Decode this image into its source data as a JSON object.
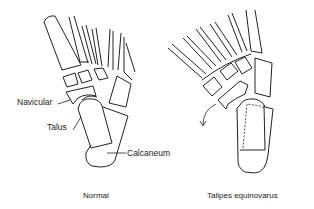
{
  "diagram": {
    "left_panel": {
      "caption": "Normal",
      "labels": {
        "navicular": "Navicular",
        "talus": "Talus",
        "calcaneum": "Calcaneum"
      }
    },
    "right_panel": {
      "caption": "Talipes equinovarus",
      "annotations": [
        "rotation-arrow"
      ]
    },
    "colors": {
      "line": "#222222",
      "background": "#ffffff"
    }
  }
}
